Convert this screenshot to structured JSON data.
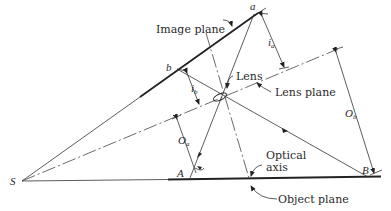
{
  "diagram": {
    "labels": {
      "image_plane": "Image plane",
      "lens": "Lens",
      "lens_plane": "Lens plane",
      "optical_axis_line1": "Optical",
      "optical_axis_line2": "axis",
      "object_plane": "Object plane"
    },
    "points": {
      "a": "a",
      "b": "b",
      "A": "A",
      "B": "B",
      "S": "S"
    },
    "distances": {
      "i_a": {
        "main": "i",
        "sub": "a"
      },
      "i_b": {
        "main": "i",
        "sub": "b"
      },
      "O_a": {
        "main": "O",
        "sub": "a"
      },
      "O_b": {
        "main": "O",
        "sub": "b"
      }
    }
  }
}
